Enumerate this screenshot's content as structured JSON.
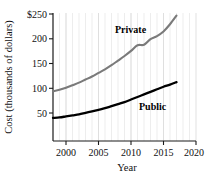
{
  "chart_data": {
    "type": "line",
    "title": "",
    "subtitle": "",
    "xlabel": "Year",
    "ylabel": "Cost (thousands of dollars)",
    "xlim": [
      1998,
      2020
    ],
    "ylim": [
      0,
      250
    ],
    "xticks": [
      "2000",
      "2005",
      "2010",
      "2015",
      "2020"
    ],
    "xtick_values": [
      2000,
      2005,
      2010,
      2015,
      2020
    ],
    "yticks": [
      "50",
      "100",
      "150",
      "200",
      "$250"
    ],
    "ytick_values": [
      50,
      100,
      150,
      200,
      250
    ],
    "grid": "vertical-minor-yearly",
    "legend_position": "inline-annotations",
    "series": [
      {
        "name": "Private",
        "color": "#7a7a7a",
        "label_text": "Private",
        "x": [
          1998,
          1999,
          2000,
          2001,
          2002,
          2003,
          2004,
          2005,
          2006,
          2007,
          2008,
          2009,
          2010,
          2011,
          2012,
          2013,
          2014,
          2015,
          2016,
          2017
        ],
        "values": [
          97,
          100,
          104,
          109,
          114,
          120,
          126,
          133,
          140,
          148,
          157,
          166,
          176,
          187,
          188,
          199,
          205,
          214,
          228,
          245
        ]
      },
      {
        "name": "Public",
        "color": "#000000",
        "label_text": "Public",
        "x": [
          1998,
          1999,
          2000,
          2001,
          2002,
          2003,
          2004,
          2005,
          2006,
          2007,
          2008,
          2009,
          2010,
          2011,
          2012,
          2013,
          2014,
          2015,
          2016,
          2017
        ],
        "values": [
          45,
          46,
          48,
          50,
          52,
          55,
          58,
          61,
          64,
          68,
          72,
          76,
          81,
          86,
          91,
          96,
          101,
          106,
          110,
          115
        ]
      }
    ]
  },
  "axis": {
    "y_label": "Cost (thousands of dollars)",
    "x_label": "Year",
    "y_tick_labels": [
      "$250",
      "200",
      "150",
      "100",
      "50"
    ],
    "x_tick_labels": [
      "2000",
      "2005",
      "2010",
      "2015",
      "2020"
    ]
  },
  "annotations": {
    "private": "Private",
    "public": "Public"
  },
  "colors": {
    "private_line": "#7a7a7a",
    "public_line": "#000000",
    "axis": "#1a1a1a",
    "gridline": "#e8e8e8",
    "background": "#ffffff"
  }
}
